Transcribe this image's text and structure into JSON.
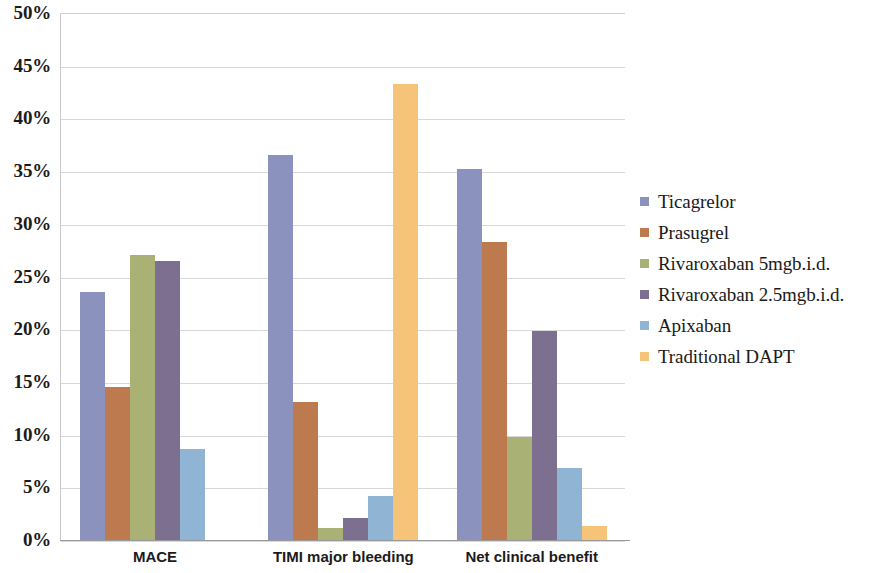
{
  "chart_data": {
    "type": "bar",
    "title": "",
    "subtitle": "",
    "xlabel": "",
    "ylabel": "",
    "categories": [
      "MACE",
      "TIMI major bleeding",
      "Net clinical benefit"
    ],
    "series": [
      {
        "name": "Ticagrelor",
        "color": "#8a92bd",
        "values": [
          23.5,
          36.5,
          35.2
        ]
      },
      {
        "name": "Prasugrel",
        "color": "#bc7a4e",
        "values": [
          14.5,
          13.1,
          28.3
        ]
      },
      {
        "name": "Rivaroxaban 5mgb.i.d.",
        "color": "#a9b274",
        "values": [
          27.0,
          1.1,
          9.8
        ]
      },
      {
        "name": "Rivaroxaban 2.5mgb.i.d.",
        "color": "#7d6f8f",
        "values": [
          26.5,
          2.1,
          19.8
        ]
      },
      {
        "name": "Apixaban",
        "color": "#8fb4d4",
        "values": [
          8.6,
          4.2,
          6.8
        ]
      },
      {
        "name": "Traditional DAPT",
        "color": "#f5c478",
        "values": [
          0.0,
          43.3,
          1.3
        ]
      }
    ],
    "ylim": [
      0,
      50
    ],
    "ytick_values": [
      0,
      5,
      10,
      15,
      20,
      25,
      30,
      35,
      40,
      45,
      50
    ],
    "ytick_labels": [
      "0%",
      "5%",
      "10%",
      "15%",
      "20%",
      "25%",
      "30%",
      "35%",
      "40%",
      "45%",
      "50%"
    ],
    "grid": true,
    "grid_axis": "y",
    "legend_position": "right",
    "value_format": "percent",
    "background_color": "#ffffff",
    "gridline_color": "#d8d8d8",
    "axis_color": "#9a9a9a"
  }
}
